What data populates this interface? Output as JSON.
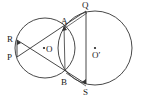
{
  "diagram": {
    "type": "two intersecting circles geometry figure",
    "points": {
      "R": "R",
      "P": "P",
      "O": "O",
      "A": "A",
      "B": "B",
      "Q": "Q",
      "S": "S",
      "O_prime": "O′"
    },
    "colors": {
      "stroke": "#333333",
      "background": "#ffffff"
    }
  }
}
